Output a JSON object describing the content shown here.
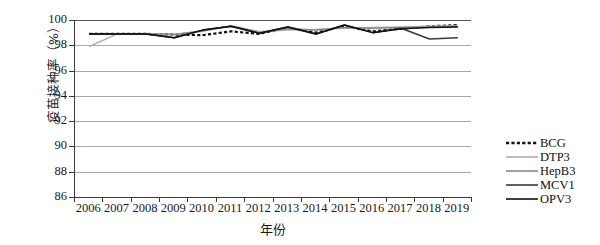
{
  "chart_data": {
    "type": "line",
    "title": "",
    "xlabel": "年份",
    "ylabel": "疫苗接种率（%）",
    "ylim": [
      86,
      100
    ],
    "ytick_labels": [
      "100",
      "98",
      "96",
      "94",
      "92",
      "90",
      "88",
      "86"
    ],
    "ytick_values": [
      100,
      98,
      96,
      94,
      92,
      90,
      88,
      86
    ],
    "grid": true,
    "legend_position": "right",
    "categories": [
      "2006",
      "2007",
      "2008",
      "2009",
      "2010",
      "2011",
      "2012",
      "2013",
      "2014",
      "2015",
      "2016",
      "2017",
      "2018",
      "2019"
    ],
    "x": [
      2006,
      2007,
      2008,
      2009,
      2010,
      2011,
      2012,
      2013,
      2014,
      2015,
      2016,
      2017,
      2018,
      2019
    ],
    "series": [
      {
        "name": "BCG",
        "style": "dotted",
        "color": "#111111",
        "values": [
          98.9,
          98.9,
          98.9,
          98.85,
          98.8,
          99.1,
          98.9,
          99.4,
          99.0,
          99.5,
          99.1,
          99.3,
          99.5,
          99.6
        ]
      },
      {
        "name": "DTP3",
        "style": "solid",
        "color": "#b0b0b0",
        "values": [
          97.9,
          98.9,
          98.9,
          98.85,
          99.1,
          99.55,
          99.1,
          99.2,
          99.25,
          99.35,
          99.4,
          99.45,
          99.5,
          99.55
        ]
      },
      {
        "name": "HepB3",
        "style": "solid",
        "color": "#8a8a8a",
        "values": [
          98.9,
          98.9,
          98.9,
          98.85,
          99.15,
          99.5,
          99.0,
          99.3,
          99.2,
          99.4,
          99.35,
          99.4,
          99.45,
          99.5
        ]
      },
      {
        "name": "MCV1",
        "style": "solid",
        "color": "#3a3a3a",
        "values": [
          98.9,
          98.9,
          98.9,
          98.6,
          99.2,
          99.5,
          98.95,
          99.45,
          98.9,
          99.6,
          99.0,
          99.35,
          98.5,
          98.6
        ]
      },
      {
        "name": "OPV3",
        "style": "solid",
        "color": "#111111",
        "values": [
          98.9,
          98.9,
          98.9,
          98.6,
          99.2,
          99.5,
          98.95,
          99.45,
          98.9,
          99.6,
          99.0,
          99.3,
          99.4,
          99.45
        ]
      }
    ]
  },
  "legend": {
    "items": [
      {
        "label": "BCG"
      },
      {
        "label": "DTP3"
      },
      {
        "label": "HepB3"
      },
      {
        "label": "MCV1"
      },
      {
        "label": "OPV3"
      }
    ]
  },
  "axes": {
    "y_title": "疫苗接种率（%）",
    "x_title": "年份"
  }
}
